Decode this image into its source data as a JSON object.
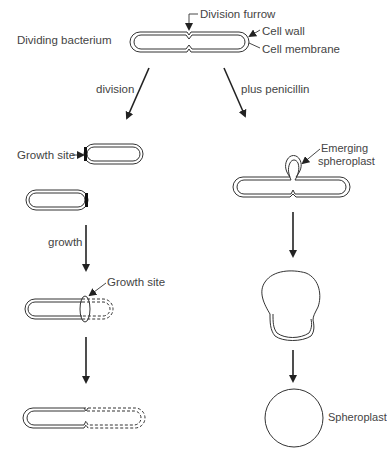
{
  "diagram": {
    "labels": {
      "dividing_bacterium": "Dividing bacterium",
      "division_furrow": "Division furrow",
      "cell_wall": "Cell wall",
      "cell_membrane": "Cell membrane",
      "division": "division",
      "plus_penicillin": "plus penicillin",
      "growth_site_1": "Growth site",
      "growth": "growth",
      "growth_site_2": "Growth site",
      "emerging_line1": "Emerging",
      "emerging_line2": "spheroplast",
      "spheroplast": "Spheroplast"
    },
    "branches": [
      {
        "name": "division",
        "stages": [
          "Daughter cells with growth sites",
          "Growth at site",
          "New dividing cell"
        ]
      },
      {
        "name": "plus penicillin",
        "stages": [
          "Emerging spheroplast",
          "Swelling cell",
          "Spheroplast"
        ]
      }
    ]
  }
}
